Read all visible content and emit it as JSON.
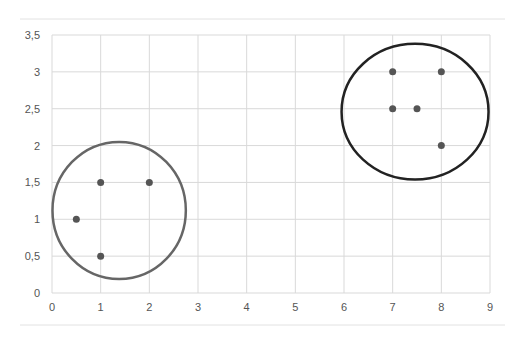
{
  "chart_data": {
    "type": "scatter",
    "title": "",
    "xlabel": "",
    "ylabel": "",
    "xlim": [
      0,
      9
    ],
    "ylim": [
      0,
      3.5
    ],
    "grid": true,
    "legend": null,
    "x_ticks": [
      "0",
      "1",
      "2",
      "3",
      "4",
      "5",
      "6",
      "7",
      "8",
      "9"
    ],
    "y_ticks": [
      "0",
      "0,5",
      "1",
      "1,5",
      "2",
      "2,5",
      "3",
      "3,5"
    ],
    "series": [
      {
        "name": "cluster-1",
        "points": [
          [
            0.5,
            1
          ],
          [
            1,
            1.5
          ],
          [
            2,
            1.5
          ],
          [
            1,
            0.5
          ]
        ]
      },
      {
        "name": "cluster-2",
        "points": [
          [
            7,
            3
          ],
          [
            8,
            3
          ],
          [
            7,
            2.5
          ],
          [
            7.5,
            2.5
          ],
          [
            8,
            2
          ]
        ]
      }
    ],
    "annotations": [
      {
        "type": "circle",
        "label": "cluster-1-boundary",
        "cx": 1.38,
        "cy": 1.12,
        "rx": 1.37,
        "ry": 0.93,
        "color": "#666666"
      },
      {
        "type": "circle",
        "label": "cluster-2-boundary",
        "cx": 7.46,
        "cy": 2.46,
        "rx": 1.51,
        "ry": 0.92,
        "color": "#222222"
      }
    ]
  },
  "colors": {
    "grid": "#d9d9d9",
    "point": "#555555",
    "axis_text": "#555555"
  }
}
